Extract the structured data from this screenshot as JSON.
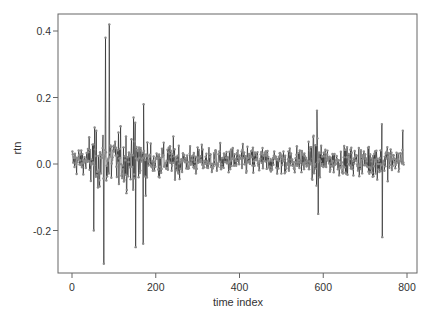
{
  "chart_data": {
    "type": "line",
    "title": "",
    "xlabel": "time index",
    "ylabel": "rtn",
    "xlim": [
      0,
      800
    ],
    "ylim": [
      -0.32,
      0.44
    ],
    "xticks": [
      0,
      200,
      400,
      600,
      800
    ],
    "xtick_labels": [
      "0",
      "200",
      "400",
      "600",
      "800"
    ],
    "yticks": [
      -0.2,
      0.0,
      0.2,
      0.4
    ],
    "ytick_labels": [
      "-0.2",
      "0.0",
      "0.2",
      "0.4"
    ],
    "grid": false,
    "legend": null,
    "markers": "points",
    "n_points": 792,
    "series": [
      {
        "name": "rtn",
        "color": "#2a2a2a",
        "marker_color": "#8a8a8a",
        "typical_range": [
          -0.1,
          0.1
        ],
        "notable_points": [
          {
            "x": 76,
            "y": -0.3
          },
          {
            "x": 80,
            "y": 0.38
          },
          {
            "x": 89,
            "y": 0.42
          },
          {
            "x": 52,
            "y": -0.2
          },
          {
            "x": 152,
            "y": 0.25
          },
          {
            "x": 152,
            "y": -0.25
          },
          {
            "x": 147,
            "y": 0.14
          },
          {
            "x": 170,
            "y": -0.24
          },
          {
            "x": 171,
            "y": 0.18
          },
          {
            "x": 585,
            "y": 0.16
          },
          {
            "x": 588,
            "y": -0.15
          },
          {
            "x": 741,
            "y": -0.22
          },
          {
            "x": 740,
            "y": 0.12
          },
          {
            "x": 790,
            "y": 0.1
          }
        ]
      }
    ]
  },
  "colors": {
    "axis": "#555555",
    "line": "#2a2a2a",
    "marker": "#8a8a8a",
    "background": "#ffffff"
  }
}
